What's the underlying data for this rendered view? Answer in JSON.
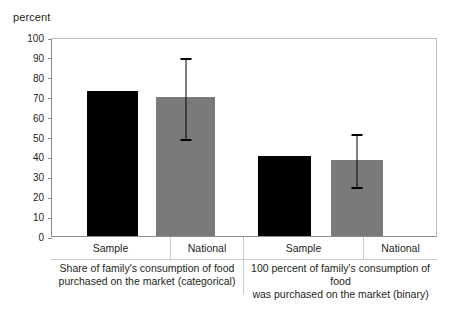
{
  "chart_data": {
    "type": "bar",
    "title": "",
    "subtitle": "",
    "xlabel": "",
    "ylabel": "percent",
    "ylim": [
      0,
      100
    ],
    "yticks": [
      0,
      10,
      20,
      30,
      40,
      50,
      60,
      70,
      80,
      90,
      100
    ],
    "grid": false,
    "legend": "none",
    "categories": [
      "Sample",
      "National",
      "Sample",
      "National"
    ],
    "values": [
      73,
      70,
      40,
      38
    ],
    "errors": [
      {
        "category": "Sample",
        "group": 0,
        "low": null,
        "high": null
      },
      {
        "category": "National",
        "group": 0,
        "low": 49,
        "high": 90
      },
      {
        "category": "Sample",
        "group": 1,
        "low": null,
        "high": null
      },
      {
        "category": "National",
        "group": 1,
        "low": 25,
        "high": 52
      }
    ],
    "bar_colors": [
      "#000000",
      "#7a7a7a",
      "#000000",
      "#7a7a7a"
    ],
    "groups": [
      {
        "caption_line1": "Share of family's consumption of food",
        "caption_line2": "purchased on the market (categorical)",
        "bars": [
          {
            "label": "Sample",
            "value": 73,
            "color": "#000000",
            "error_low": null,
            "error_high": null
          },
          {
            "label": "National",
            "value": 70,
            "color": "#7a7a7a",
            "error_low": 49,
            "error_high": 90
          }
        ]
      },
      {
        "caption_line1": "100 percent of family's consumption of food",
        "caption_line2": "was purchased on the market (binary)",
        "bars": [
          {
            "label": "Sample",
            "value": 40,
            "color": "#000000",
            "error_low": null,
            "error_high": null
          },
          {
            "label": "National",
            "value": 38,
            "color": "#7a7a7a",
            "error_low": 25,
            "error_high": 52
          }
        ]
      }
    ]
  },
  "axis": {
    "y_title": "percent",
    "tick_labels": [
      "100",
      "90",
      "80",
      "70",
      "60",
      "50",
      "40",
      "30",
      "20",
      "10",
      "0"
    ]
  },
  "colors": {
    "bar_black": "#000000",
    "bar_gray": "#7a7a7a",
    "error_bar": "#000000",
    "frame": "#8c8c8c",
    "frame_light": "#bfbfbf",
    "box_border": "#c9c9c9",
    "text": "#231f20",
    "background": "#ffffff"
  }
}
